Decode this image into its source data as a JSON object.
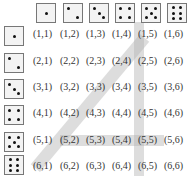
{
  "column_dice": [
    1,
    2,
    3,
    4,
    5,
    6
  ],
  "row_dice": [
    1,
    2,
    3,
    4,
    5,
    6
  ],
  "cells": [
    [
      "(1,1)",
      "(1,2)",
      "(1,3)",
      "(1,4)",
      "(1,5)",
      "(1,6)"
    ],
    [
      "(2,1)",
      "(2,2)",
      "(2,3)",
      "(2,4)",
      "(2,5)",
      "(2,6)"
    ],
    [
      "(3,1)",
      "(3,2)",
      "(3,3)",
      "(3,4)",
      "(3,5)",
      "(3,6)"
    ],
    [
      "(4,1)",
      "(4,2)",
      "(4,3)",
      "(4,4)",
      "(4,5)",
      "(4,6)"
    ],
    [
      "(5,1)",
      "(5,2)",
      "(5,3)",
      "(5,4)",
      "(5,5)",
      "(5,6)"
    ],
    [
      "(6,1)",
      "(6,2)",
      "(6,3)",
      "(6,4)",
      "(6,5)",
      "(6,6)"
    ]
  ],
  "highlights": {
    "row": 5,
    "column": 5,
    "diagonal": "sum = 7"
  },
  "colors": {
    "highlight": "#bdbdbd",
    "die_fill": "#f3f3f3",
    "pip": "#111111"
  }
}
